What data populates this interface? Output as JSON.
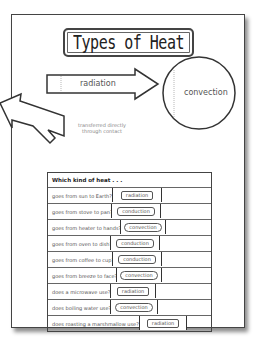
{
  "title": "Types of Heat",
  "diagram": {
    "arrow_label": "radiation",
    "circle_label": "convection",
    "note_line1": "transferred directly",
    "note_line2": "through contact"
  },
  "table": {
    "header": "Which kind of heat . . .",
    "rows": [
      {
        "question": "goes from sun to Earth?",
        "answer": "radiation",
        "type": "rad",
        "x": 64
      },
      {
        "question": "goes from stove to pan?",
        "answer": "conduction",
        "type": "cond",
        "x": 63
      },
      {
        "question": "goes from heater to hands?",
        "answer": "convection",
        "type": "conv",
        "x": 72
      },
      {
        "question": "goes from oven to dish?",
        "answer": "conduction",
        "type": "cond",
        "x": 62
      },
      {
        "question": "goes from coffee to cup?",
        "answer": "conduction",
        "type": "cond",
        "x": 64
      },
      {
        "question": "goes from breeze to face?",
        "answer": "convection",
        "type": "conv",
        "x": 68
      },
      {
        "question": "does a microwave use?",
        "answer": "radiation",
        "type": "rad",
        "x": 62
      },
      {
        "question": "does boiling water use?",
        "answer": "convection",
        "type": "conv",
        "x": 62
      },
      {
        "question": "does roasting a marshmallow use?",
        "answer": "radiation",
        "type": "rad",
        "x": 91
      }
    ]
  }
}
